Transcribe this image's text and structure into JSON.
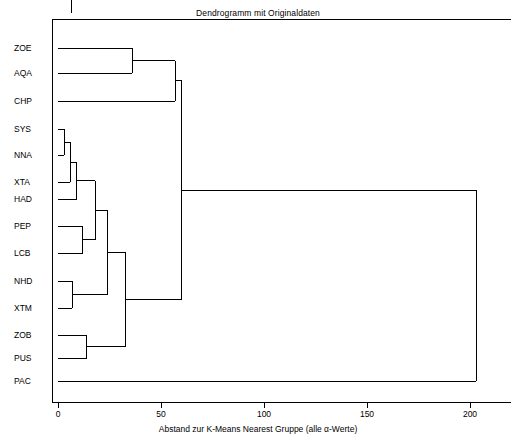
{
  "chart_data": {
    "type": "dendrogram",
    "title": "Dendrogramm mit Originaldaten",
    "xlabel": "Abstand zur K-Means Nearest Gruppe (alle α-Werte)",
    "ylabel": "",
    "xlim": [
      0,
      220
    ],
    "xticks": [
      0,
      50,
      100,
      150,
      200
    ],
    "xticklabels": [
      "0",
      "50",
      "100",
      "150",
      "200"
    ],
    "grid": false,
    "legend": null,
    "leaves": [
      "ZOE",
      "AQA",
      "CHP",
      "SYS",
      "NNA",
      "XTA",
      "HAD",
      "PEP",
      "LCB",
      "NHD",
      "XTM",
      "ZOB",
      "PUS",
      "PAC"
    ],
    "merges": [
      {
        "id": "m1",
        "left": "SYS",
        "right": "NNA",
        "height": 3
      },
      {
        "id": "m2",
        "left": "m1",
        "right": "XTA",
        "height": 6
      },
      {
        "id": "m3",
        "left": "NHD",
        "right": "XTM",
        "height": 7
      },
      {
        "id": "m4",
        "left": "m2",
        "right": "HAD",
        "height": 9
      },
      {
        "id": "m5",
        "left": "PEP",
        "right": "LCB",
        "height": 12
      },
      {
        "id": "m6",
        "left": "ZOB",
        "right": "PUS",
        "height": 14
      },
      {
        "id": "m7",
        "left": "m4",
        "right": "m5",
        "height": 18
      },
      {
        "id": "m8",
        "left": "m7",
        "right": "m3",
        "height": 24
      },
      {
        "id": "m9",
        "left": "m8",
        "right": "m6",
        "height": 33
      },
      {
        "id": "m10",
        "left": "ZOE",
        "right": "AQA",
        "height": 36
      },
      {
        "id": "m11",
        "left": "m10",
        "right": "CHP",
        "height": 57
      },
      {
        "id": "m12",
        "left": "m11",
        "right": "m9",
        "height": 60
      },
      {
        "id": "m13",
        "left": "m12",
        "right": "PAC",
        "height": 203
      }
    ]
  },
  "axis": {
    "tick_values": [
      "0",
      "50",
      "100",
      "150",
      "200"
    ]
  }
}
